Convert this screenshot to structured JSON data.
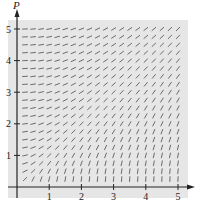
{
  "chart_data": {
    "type": "slope_field",
    "title": "",
    "xlabel": "",
    "ylabel": "P",
    "x_ticks": [
      "1",
      "2",
      "3",
      "4",
      "5"
    ],
    "y_ticks": [
      "1",
      "2",
      "3",
      "4",
      "5"
    ],
    "xlim": [
      0,
      5.2
    ],
    "ylim": [
      0,
      5.2
    ],
    "grid_step": 0.25,
    "slope_expression": "dP/dt = t / P",
    "segment_color": "#4a4a4a",
    "panel_color": "#e6e6e6",
    "axis_color": "#222222",
    "grid": false,
    "legend": null
  },
  "axes": {
    "y_label": "P",
    "x_tick_labels": [
      "1",
      "2",
      "3",
      "4",
      "5"
    ],
    "y_tick_labels": [
      "1",
      "2",
      "3",
      "4",
      "5"
    ]
  }
}
